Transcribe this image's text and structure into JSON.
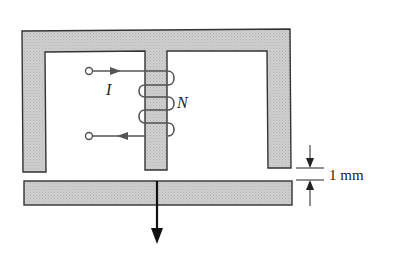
{
  "diagram": {
    "title": "",
    "labels": {
      "current": "I",
      "turns": "N",
      "gap": "1 mm"
    },
    "colors": {
      "core_fill": "#c9c9c9",
      "core_stroke": "#333333",
      "wire": "#555555",
      "background": "#ffffff"
    },
    "components": [
      "E-shaped magnetic core",
      "coil with N turns on center leg",
      "current input terminal",
      "current output terminal",
      "movable armature bar",
      "force arrow (downward)",
      "air-gap dimension marker"
    ]
  }
}
